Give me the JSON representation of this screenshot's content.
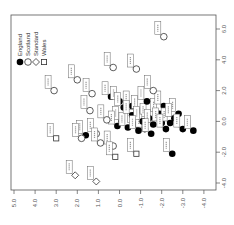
{
  "chart_data": {
    "type": "scatter",
    "title": "",
    "orientation": "rotated 90 degrees clockwise (text reads bottom-to-top)",
    "xlabel": "",
    "ylabel": "",
    "x_axis": {
      "side": "bottom",
      "ticks": [
        "5.0",
        "4.0",
        "3.0",
        "2.0",
        "1.0",
        "0.0",
        "-1.0",
        "-2.0",
        "-3.0",
        "-4.0"
      ],
      "range": [
        5.3,
        -4.5
      ]
    },
    "y_axis": {
      "side": "right",
      "ticks": [
        "6.0",
        "4.0",
        "2.0",
        "0.0",
        "-2.0",
        "-4.0"
      ],
      "range": [
        6.5,
        -4.3
      ]
    },
    "grid": false,
    "legend": {
      "position": "top-left",
      "entries": [
        {
          "label": "England",
          "marker": "filled-circle"
        },
        {
          "label": "Scotland",
          "marker": "open-circle"
        },
        {
          "label": "Standard",
          "marker": "diamond"
        },
        {
          "label": "Wales",
          "marker": "square"
        }
      ]
    },
    "series": [
      {
        "name": "England",
        "marker": "filled-circle",
        "points": [
          [
            0.4,
            1.6
          ],
          [
            0.0,
            1.3
          ],
          [
            -0.2,
            0.9
          ],
          [
            -0.6,
            1.0
          ],
          [
            -1.0,
            0.7
          ],
          [
            -1.4,
            0.2
          ],
          [
            -1.9,
            0.5
          ],
          [
            -2.1,
            1.0
          ],
          [
            -2.8,
            0.5
          ],
          [
            -0.1,
            0.0
          ],
          [
            0.1,
            -0.3
          ],
          [
            -0.4,
            -0.4
          ],
          [
            -0.8,
            -0.2
          ],
          [
            -1.2,
            -0.5
          ],
          [
            -1.6,
            -0.2
          ],
          [
            -2.0,
            -0.1
          ],
          [
            -2.4,
            -0.1
          ],
          [
            -2.6,
            0.2
          ],
          [
            -3.0,
            -0.5
          ],
          [
            -3.5,
            -0.6
          ],
          [
            -0.6,
            0.4
          ],
          [
            -1.3,
            1.3
          ],
          [
            -2.2,
            -0.5
          ],
          [
            1.6,
            -0.9
          ],
          [
            -1.1,
            0.0
          ],
          [
            -0.9,
            -0.6
          ],
          [
            -1.5,
            -0.8
          ],
          [
            -2.5,
            -2.1
          ]
        ]
      },
      {
        "name": "Scotland",
        "marker": "open-circle",
        "points": [
          [
            -2.1,
            5.5
          ],
          [
            2.0,
            2.7
          ],
          [
            1.3,
            1.8
          ],
          [
            3.1,
            2.0
          ],
          [
            0.3,
            3.5
          ],
          [
            -0.8,
            3.4
          ],
          [
            1.8,
            -1.1
          ],
          [
            1.1,
            -0.8
          ],
          [
            0.9,
            -1.4
          ],
          [
            0.3,
            -1.6
          ],
          [
            0.6,
            0.1
          ],
          [
            -1.6,
            2.0
          ],
          [
            1.4,
            0.7
          ]
        ]
      },
      {
        "name": "Standard",
        "marker": "diamond",
        "points": [
          [
            2.1,
            -3.5
          ],
          [
            1.1,
            -3.9
          ]
        ]
      },
      {
        "name": "Wales",
        "marker": "square",
        "points": [
          [
            3.0,
            -1.1
          ],
          [
            0.2,
            -2.3
          ],
          [
            -0.8,
            -2.1
          ]
        ]
      }
    ],
    "point_labels_note": "Each point has a small boxed rotated text label (3–4 letter code); not legible at this resolution"
  }
}
